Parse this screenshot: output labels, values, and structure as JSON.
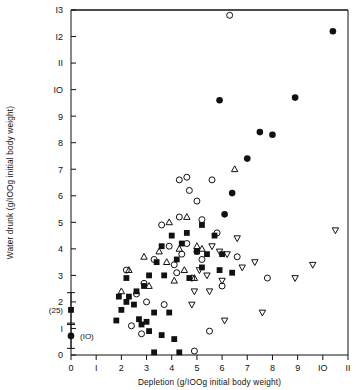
{
  "figure": {
    "background": "#ffffff",
    "ink": "#111111",
    "frame": {
      "left": 71,
      "right": 348,
      "top": 10,
      "bottom": 355
    }
  },
  "chart_data": {
    "type": "scatter",
    "title": "",
    "xlabel": "Depletion (g/IOOg initial body weight)",
    "ylabel": "Water drunk (g/IOOg initial body weight)",
    "xlim": [
      0,
      11
    ],
    "ylim": [
      0,
      13
    ],
    "xticks": [
      0,
      1,
      2,
      3,
      4,
      5,
      6,
      7,
      8,
      9,
      10,
      11
    ],
    "xticklabels": [
      "0",
      "I",
      "2",
      "3",
      "4",
      "5",
      "6",
      "7",
      "8",
      "9",
      "IO",
      "II"
    ],
    "yticks": [
      0,
      1,
      2,
      3,
      4,
      5,
      6,
      7,
      8,
      9,
      10,
      11,
      12,
      13
    ],
    "yticklabels": [
      "0",
      "I",
      "2",
      "3",
      "4",
      "5",
      "6",
      "7",
      "8",
      "9",
      "IO",
      "II",
      "I2",
      "I3"
    ],
    "grid": false,
    "legend": "none",
    "series": [
      {
        "name": "filled-circle",
        "marker": "filled-circle",
        "color": "#111111",
        "points": [
          [
            5.9,
            9.6
          ],
          [
            8.9,
            9.7
          ],
          [
            7.5,
            8.4
          ],
          [
            8.0,
            8.3
          ],
          [
            7.0,
            7.4
          ],
          [
            6.4,
            6.1
          ],
          [
            10.4,
            12.2
          ],
          [
            6.1,
            5.3
          ]
        ]
      },
      {
        "name": "open-circle",
        "marker": "open-circle",
        "color": "#111111",
        "points": [
          [
            6.3,
            12.8
          ],
          [
            4.3,
            6.6
          ],
          [
            4.6,
            6.7
          ],
          [
            4.7,
            6.2
          ],
          [
            5.6,
            6.6
          ],
          [
            5.0,
            5.8
          ],
          [
            4.3,
            5.2
          ],
          [
            5.2,
            5.1
          ],
          [
            5.8,
            4.6
          ],
          [
            3.6,
            4.9
          ],
          [
            4.6,
            4.2
          ],
          [
            3.9,
            4.1
          ],
          [
            4.4,
            3.8
          ],
          [
            5.0,
            3.9
          ],
          [
            5.2,
            3.6
          ],
          [
            3.3,
            3.6
          ],
          [
            4.1,
            3.4
          ],
          [
            4.2,
            3.1
          ],
          [
            4.8,
            2.9
          ],
          [
            6.0,
            2.6
          ],
          [
            7.8,
            2.9
          ],
          [
            2.9,
            2.7
          ],
          [
            2.6,
            2.3
          ],
          [
            3.0,
            2.0
          ],
          [
            2.4,
            1.1
          ],
          [
            2.8,
            0.8
          ],
          [
            5.5,
            0.9
          ],
          [
            4.9,
            0.15
          ],
          [
            3.7,
            1.9
          ],
          [
            6.6,
            3.7
          ],
          [
            2.2,
            3.2
          ]
        ]
      },
      {
        "name": "open-triangle-up",
        "marker": "open-triangle-up",
        "color": "#111111",
        "points": [
          [
            6.5,
            7.0
          ],
          [
            4.6,
            5.2
          ],
          [
            3.9,
            5.0
          ],
          [
            5.0,
            4.1
          ],
          [
            4.3,
            4.0
          ],
          [
            3.5,
            3.9
          ],
          [
            3.8,
            3.5
          ],
          [
            2.9,
            3.7
          ],
          [
            4.5,
            3.2
          ],
          [
            4.1,
            2.8
          ],
          [
            3.1,
            2.6
          ],
          [
            2.3,
            3.2
          ],
          [
            2.0,
            2.4
          ],
          [
            5.2,
            4.0
          ],
          [
            4.9,
            2.9
          ]
        ]
      },
      {
        "name": "open-triangle-down",
        "marker": "open-triangle-down",
        "color": "#111111",
        "points": [
          [
            6.6,
            4.4
          ],
          [
            5.6,
            4.1
          ],
          [
            5.9,
            3.9
          ],
          [
            6.2,
            3.8
          ],
          [
            10.5,
            4.7
          ],
          [
            7.3,
            3.5
          ],
          [
            6.8,
            3.3
          ],
          [
            5.1,
            3.2
          ],
          [
            5.4,
            3.0
          ],
          [
            6.0,
            2.8
          ],
          [
            8.9,
            2.9
          ],
          [
            9.6,
            3.4
          ],
          [
            4.9,
            2.4
          ],
          [
            5.5,
            2.4
          ],
          [
            4.8,
            1.9
          ],
          [
            7.6,
            1.6
          ],
          [
            6.1,
            1.3
          ]
        ]
      },
      {
        "name": "filled-square",
        "marker": "filled-square",
        "color": "#111111",
        "points": [
          [
            5.2,
            4.9
          ],
          [
            4.6,
            4.6
          ],
          [
            5.7,
            4.5
          ],
          [
            4.0,
            4.5
          ],
          [
            4.4,
            4.2
          ],
          [
            3.6,
            4.1
          ],
          [
            5.0,
            3.9
          ],
          [
            5.4,
            3.8
          ],
          [
            6.0,
            3.8
          ],
          [
            4.2,
            3.6
          ],
          [
            3.4,
            3.5
          ],
          [
            5.2,
            3.3
          ],
          [
            5.9,
            3.2
          ],
          [
            6.4,
            3.1
          ],
          [
            3.1,
            3.0
          ],
          [
            3.7,
            3.0
          ],
          [
            4.7,
            2.9
          ],
          [
            2.9,
            2.6
          ],
          [
            2.6,
            2.4
          ],
          [
            2.3,
            2.2
          ],
          [
            1.9,
            2.2
          ],
          [
            2.2,
            2.0
          ],
          [
            2.5,
            1.9
          ],
          [
            2.0,
            1.7
          ],
          [
            3.3,
            1.6
          ],
          [
            3.9,
            1.6
          ],
          [
            2.7,
            1.35
          ],
          [
            3.0,
            1.25
          ],
          [
            2.8,
            1.15
          ],
          [
            3.1,
            0.9
          ],
          [
            3.6,
            0.75
          ],
          [
            4.1,
            0.6
          ],
          [
            3.3,
            0.1
          ],
          [
            4.3,
            0.1
          ],
          [
            2.2,
            2.9
          ],
          [
            1.8,
            1.3
          ]
        ]
      }
    ],
    "inset": {
      "note": "mean with range bars plotted at depletion = 0",
      "items": [
        {
          "label": "(25)",
          "marker": "filled-square",
          "x": 0.0,
          "y": 1.7,
          "error_low": 1.2,
          "error_high": 2.35,
          "label_side": "left"
        },
        {
          "label": "(IO)",
          "marker": "filled-circle",
          "x": 0.0,
          "y": 0.72,
          "error_low": 0.25,
          "error_high": 1.15,
          "label_side": "right"
        }
      ]
    }
  }
}
